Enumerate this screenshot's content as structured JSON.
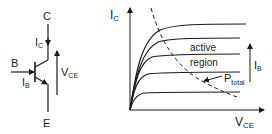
{
  "transistor": {
    "collector_label": "C",
    "base_label": "B",
    "emitter_label": "E",
    "collector_current": {
      "main": "I",
      "sub": "C"
    },
    "base_current": {
      "main": "I",
      "sub": "B"
    },
    "vce": {
      "main": "V",
      "sub": "CE"
    }
  },
  "plot": {
    "y_axis": {
      "main": "I",
      "sub": "C"
    },
    "x_axis": {
      "main": "V",
      "sub": "CE"
    },
    "region_label_line1": "active",
    "region_label_line2": "region",
    "power_label": {
      "main": "P",
      "sub": "total"
    },
    "ib_arrow_label": {
      "main": "I",
      "sub": "B"
    },
    "curve_levels": [
      24,
      38,
      54,
      72,
      92
    ]
  },
  "colors": {
    "stroke": "#1a1a1a",
    "background": "#ffffff"
  }
}
